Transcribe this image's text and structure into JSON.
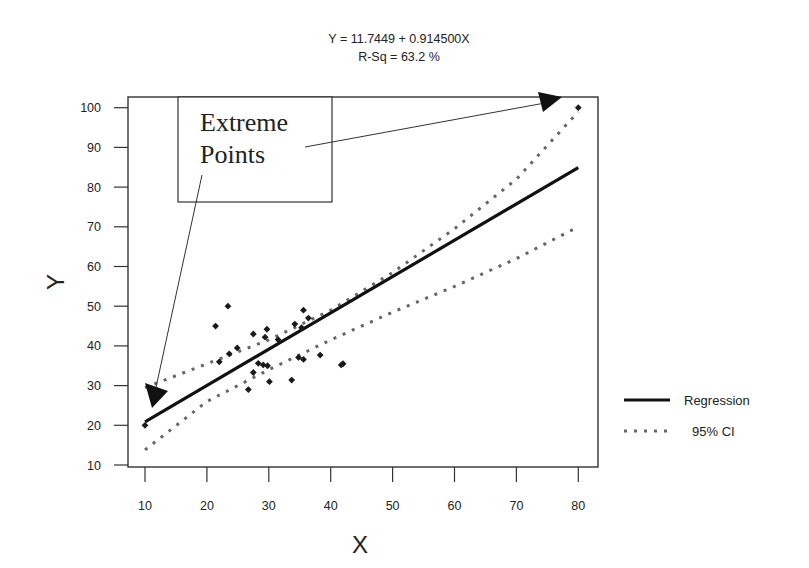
{
  "chart_data": {
    "type": "scatter",
    "title": "Y = 11.7449 + 0.914500X",
    "subtitle": "R-Sq = 63.2 %",
    "xlabel": "X",
    "ylabel": "Y",
    "xlim": [
      7,
      83
    ],
    "ylim": [
      10,
      102
    ],
    "x_ticks": [
      10,
      20,
      30,
      40,
      50,
      60,
      70,
      80
    ],
    "y_ticks": [
      10,
      20,
      30,
      40,
      50,
      60,
      70,
      80,
      90,
      100
    ],
    "grid": false,
    "legend_position": "right",
    "regression": {
      "intercept": 11.7449,
      "slope": 0.9145,
      "r_sq_percent": 63.2
    },
    "series": [
      {
        "name": "Data",
        "kind": "scatter",
        "points": [
          [
            10,
            20
          ],
          [
            21.4,
            45
          ],
          [
            23.4,
            50
          ],
          [
            22,
            36
          ],
          [
            23.6,
            38
          ],
          [
            24.9,
            39.5
          ],
          [
            26.7,
            29
          ],
          [
            27.5,
            33.3
          ],
          [
            27.5,
            43
          ],
          [
            28.3,
            35.6
          ],
          [
            29.1,
            35.2
          ],
          [
            29.8,
            35
          ],
          [
            29.4,
            42.2
          ],
          [
            29.7,
            44.2
          ],
          [
            30.1,
            31
          ],
          [
            31.5,
            41.6
          ],
          [
            33.7,
            31.4
          ],
          [
            34.2,
            45.5
          ],
          [
            35.3,
            44.6
          ],
          [
            34.8,
            37.1
          ],
          [
            35.6,
            36.6
          ],
          [
            35.6,
            49
          ],
          [
            36.4,
            47
          ],
          [
            38.3,
            37.7
          ],
          [
            41.7,
            35.2
          ],
          [
            42,
            35.5
          ],
          [
            80,
            100
          ]
        ]
      },
      {
        "name": "Regression",
        "kind": "line",
        "x": [
          10,
          80
        ],
        "y": [
          20.89,
          84.9
        ]
      },
      {
        "name": "95% CI upper",
        "kind": "dotted-line",
        "x": [
          10,
          20,
          30,
          40,
          50,
          60,
          70,
          80
        ],
        "y": [
          29.5,
          35.5,
          41.5,
          49,
          58.5,
          69.5,
          82,
          99
        ]
      },
      {
        "name": "95% CI lower",
        "kind": "dotted-line",
        "x": [
          10,
          20,
          30,
          40,
          50,
          60,
          70,
          80
        ],
        "y": [
          13.8,
          26,
          34,
          41.5,
          48.5,
          55,
          62,
          70
        ]
      }
    ],
    "legend": [
      {
        "label": "Regression",
        "style": "solid"
      },
      {
        "label": "95% CI",
        "style": "dotted"
      }
    ],
    "annotations": [
      {
        "text": "Extreme Points",
        "line1": "Extreme",
        "line2": "Points",
        "arrows_to": [
          [
            10,
            20
          ],
          [
            80,
            100
          ]
        ]
      }
    ]
  },
  "colors": {
    "axis": "#333333",
    "points": "#1a1a1a",
    "regression": "#111111",
    "ci": "#666666"
  }
}
